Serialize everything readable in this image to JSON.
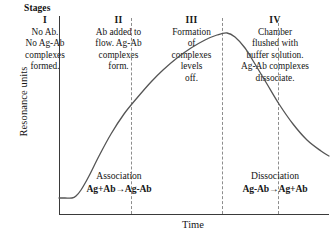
{
  "figure": {
    "stages_header": "Stages",
    "axes": {
      "y_label": "Resonance units",
      "x_label": "Time"
    }
  },
  "stages": [
    {
      "roman": "I",
      "lines": [
        "No Ab.",
        "No Ag-Ab",
        "complexes",
        "formed."
      ]
    },
    {
      "roman": "II",
      "lines": [
        "Ab added to",
        "flow. Ag-Ab",
        "complexes",
        "form."
      ]
    },
    {
      "roman": "III",
      "lines": [
        "Formation",
        "of",
        "complexes",
        "levels",
        "off."
      ]
    },
    {
      "roman": "IV",
      "lines": [
        "Chamber",
        "flushed with",
        "buffer solution.",
        "Ag-Ab complexes",
        "dissociate."
      ]
    }
  ],
  "phases": {
    "association": {
      "name": "Association",
      "equation": "Ag+Ab→Ag-Ab"
    },
    "dissociation": {
      "name": "Dissociation",
      "equation": "Ag-Ab→Ag+Ab"
    }
  },
  "colors": {
    "curve": "#555555",
    "axis": "#3a3a3a",
    "divider": "#8d8d8d",
    "text": "#161616",
    "background": "#ffffff"
  },
  "chart_data": {
    "type": "line",
    "xlabel": "Time",
    "ylabel": "Resonance units",
    "grid": false,
    "legend": "none",
    "xlim": [
      0,
      271
    ],
    "ylim": [
      0,
      207
    ],
    "axis_ticks": {
      "x": [],
      "y": []
    },
    "stage_boundaries_x": [
      13,
      104,
      160
    ],
    "series": [
      {
        "name": "Resonance signal",
        "points": [
          [
            0,
            190
          ],
          [
            6,
            190
          ],
          [
            13,
            190
          ],
          [
            17,
            188
          ],
          [
            22,
            182
          ],
          [
            30,
            168
          ],
          [
            40,
            148
          ],
          [
            52,
            126
          ],
          [
            65,
            106
          ],
          [
            78,
            90
          ],
          [
            92,
            74
          ],
          [
            104,
            62
          ],
          [
            118,
            50
          ],
          [
            132,
            40
          ],
          [
            146,
            32
          ],
          [
            158,
            27
          ],
          [
            168,
            25
          ],
          [
            176,
            29
          ],
          [
            186,
            40
          ],
          [
            196,
            56
          ],
          [
            208,
            76
          ],
          [
            220,
            96
          ],
          [
            234,
            116
          ],
          [
            248,
            132
          ],
          [
            262,
            143
          ],
          [
            270,
            148
          ]
        ]
      }
    ],
    "annotations": [
      {
        "text": "Association",
        "x": 60,
        "y": 175
      },
      {
        "text": "Ag+Ab→Ag-Ab",
        "x": 60,
        "y": 188
      },
      {
        "text": "Dissociation",
        "x": 216,
        "y": 175
      },
      {
        "text": "Ag-Ab→Ag+Ab",
        "x": 216,
        "y": 188
      }
    ]
  }
}
